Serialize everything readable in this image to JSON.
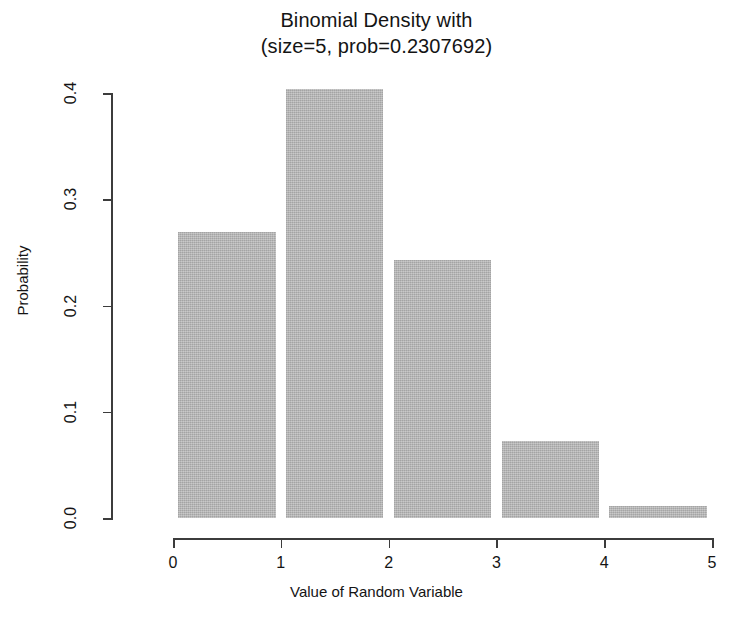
{
  "chart_data": {
    "type": "bar",
    "title": "Binomial Density with (size=5, prob=0.2307692)",
    "title_lines": [
      "Binomial Density with",
      "(size=5, prob=0.2307692)"
    ],
    "xlabel": "Value of Random Variable",
    "ylabel": "Probability",
    "categories": [
      "0",
      "1",
      "2",
      "3",
      "4"
    ],
    "x": [
      0,
      1,
      2,
      3,
      4
    ],
    "values": [
      0.2695,
      0.4042,
      0.2425,
      0.0728,
      0.0109
    ],
    "xlim": [
      0,
      5
    ],
    "ylim": [
      0.0,
      0.4
    ],
    "xticks": [
      "0",
      "1",
      "2",
      "3",
      "4",
      "5"
    ],
    "xtick_values": [
      0,
      1,
      2,
      3,
      4,
      5
    ],
    "yticks": [
      "0.0",
      "0.1",
      "0.2",
      "0.3",
      "0.4"
    ],
    "ytick_values": [
      0.0,
      0.1,
      0.2,
      0.3,
      0.4
    ],
    "grid": false,
    "legend": false,
    "bar_color": "#b5b5b5",
    "axis_color": "#3c3c3c",
    "background": "#ffffff",
    "distribution": {
      "family": "binomial",
      "size": 5,
      "prob": 0.2307692
    }
  }
}
